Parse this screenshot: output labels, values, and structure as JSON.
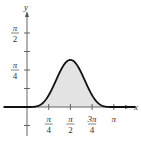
{
  "chart_data": {
    "type": "area",
    "title": "",
    "function": "y = sin^4(x)",
    "xlabel": "x",
    "ylabel": "y",
    "xlim": [
      -0.3,
      3.5
    ],
    "ylim": [
      -0.4,
      1.75
    ],
    "x_ticks": [
      {
        "value": 0.7854,
        "num": "π",
        "den": "4"
      },
      {
        "value": 1.5708,
        "num": "π",
        "den": "2"
      },
      {
        "value": 2.3562,
        "num": "3π",
        "den": "4"
      },
      {
        "value": 3.1416,
        "num": "π",
        "den": ""
      }
    ],
    "y_ticks": [
      {
        "value": -0.3927,
        "num": "",
        "den": ""
      },
      {
        "value": 0.3927,
        "num": "",
        "den": ""
      },
      {
        "value": 0.7854,
        "num": "π",
        "den": "4"
      },
      {
        "value": 1.1781,
        "num": "",
        "den": ""
      },
      {
        "value": 1.5708,
        "num": "π",
        "den": "2"
      }
    ],
    "shaded_region": {
      "from": 0,
      "to": 3.1416
    },
    "peak": {
      "x": 1.5708,
      "y": 1.0
    },
    "grid": false,
    "colors": {
      "curve": "#111111",
      "fill": "#e3e3e3",
      "axis": "#555555"
    }
  }
}
